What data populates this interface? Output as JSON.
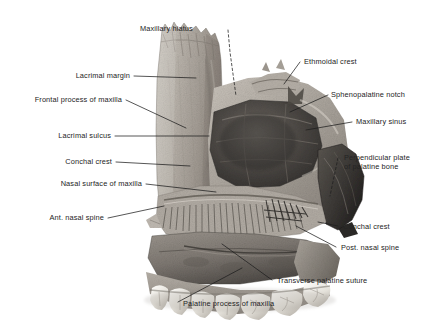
{
  "figure": {
    "background_color": "#ffffff",
    "text_color": "#242424",
    "leader_color": "#1e1e1e",
    "style": "grayscale halftone anatomical photograph with leader-line labels"
  },
  "labels": {
    "maxillary_hiatus": "Maxillary hiatus",
    "lacrimal_margin": "Lacrimal margin",
    "frontal_process_of_maxilla": "Frontal process of maxilla",
    "lacrimal_sulcus": "Lacrimal sulcus",
    "conchal_crest_upper": "Conchal crest",
    "nasal_surface_of_maxilla": "Nasal surface of maxilla",
    "ant_nasal_spine": "Ant. nasal spine",
    "ethmoidal_crest": "Ethmoidal crest",
    "sphenopalatine_notch": "Sphenopalatine notch",
    "maxillary_sinus": "Maxillary sinus",
    "perpendicular_plate_of_palatine_bone": "Perpendicular plate of palatine bone",
    "conchal_crest_lower": "Conchal crest",
    "post_nasal_spine": "Post. nasal spine",
    "transverse_palatine_suture": "Transverse palatine suture",
    "palatine_process_of_maxilla": "Palatine process of maxilla"
  }
}
